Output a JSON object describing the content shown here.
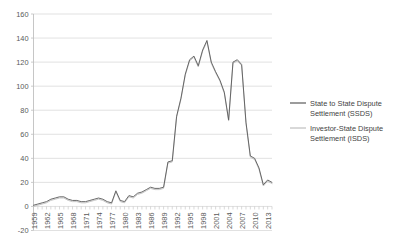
{
  "chart_data": {
    "type": "line",
    "title": "",
    "subtitle": "",
    "xlabel": "",
    "ylabel": "",
    "grid": true,
    "grid_axis": "y",
    "legend_position": "right",
    "xlim": [
      1959,
      2014
    ],
    "ylim": [
      -20,
      160
    ],
    "ytick_step": 20,
    "xtick_step": 3,
    "ytick_labels": [
      "160",
      "140",
      "120",
      "100",
      "80",
      "60",
      "40",
      "20",
      "0",
      "-20"
    ],
    "ytick_values": [
      160,
      140,
      120,
      100,
      80,
      60,
      40,
      20,
      0,
      -20
    ],
    "xtick_labels": [
      "1959",
      "1962",
      "1965",
      "1968",
      "1971",
      "1974",
      "1977",
      "1980",
      "1983",
      "1986",
      "1989",
      "1992",
      "1995",
      "1998",
      "2001",
      "2004",
      "2007",
      "2010",
      "2013"
    ],
    "xtick_values": [
      1959,
      1962,
      1965,
      1968,
      1971,
      1974,
      1977,
      1980,
      1983,
      1986,
      1989,
      1992,
      1995,
      1998,
      2001,
      2004,
      2007,
      2010,
      2013
    ],
    "x": [
      1959,
      1960,
      1961,
      1962,
      1963,
      1964,
      1965,
      1966,
      1967,
      1968,
      1969,
      1970,
      1971,
      1972,
      1973,
      1974,
      1975,
      1976,
      1977,
      1978,
      1979,
      1980,
      1981,
      1982,
      1983,
      1984,
      1985,
      1986,
      1987,
      1988,
      1989,
      1990,
      1991,
      1992,
      1993,
      1994,
      1995,
      1996,
      1997,
      1998,
      1999,
      2000,
      2001,
      2002,
      2003,
      2004,
      2005,
      2006,
      2007,
      2008,
      2009,
      2010,
      2011,
      2012,
      2013,
      2014
    ],
    "series": [
      {
        "name": "State to State Dispute Settlement (SSDS)",
        "color": "#595959",
        "values": [
          1,
          2,
          3,
          4,
          6,
          7,
          8,
          8,
          6,
          5,
          5,
          4,
          4,
          5,
          6,
          7,
          6,
          4,
          3,
          13,
          5,
          4,
          9,
          8,
          11,
          12,
          14,
          16,
          15,
          15,
          16,
          37,
          38,
          75,
          90,
          110,
          122,
          125,
          117,
          130,
          138,
          120,
          112,
          105,
          95,
          72,
          120,
          122,
          118,
          70,
          42,
          40,
          32,
          18,
          22,
          20
        ]
      },
      {
        "name": "Investor-State Dispute Settlement (ISDS)",
        "color": "#bfbfbf",
        "values": [
          0,
          1,
          2,
          3,
          5,
          6,
          7,
          7,
          5,
          4,
          4,
          3,
          3,
          4,
          5,
          6,
          5,
          3,
          2,
          12,
          4,
          3,
          8,
          7,
          10,
          11,
          13,
          15,
          14,
          14,
          15,
          36,
          37,
          74,
          89,
          109,
          121,
          124,
          116,
          129,
          137,
          119,
          111,
          104,
          94,
          71,
          119,
          121,
          117,
          69,
          41,
          39,
          31,
          17,
          21,
          19
        ]
      }
    ]
  },
  "legend": {
    "items": [
      {
        "label_line1": "State to State Dispute",
        "label_line2": "Settlement (SSDS)",
        "color": "#595959"
      },
      {
        "label_line1": "Investor-State Dispute",
        "label_line2": "Settlement (ISDS)",
        "color": "#bfbfbf"
      }
    ]
  },
  "colors": {
    "grid": "#d9d9d9",
    "axis": "#bfbfbf",
    "text": "#5a5a5a",
    "background": "#ffffff"
  }
}
